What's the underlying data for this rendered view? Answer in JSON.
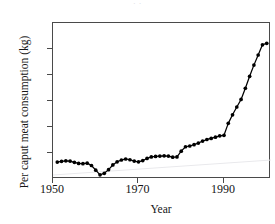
{
  "figure": {
    "title_remnant": "· ·",
    "background": "#ffffff",
    "line_color": "#000000",
    "marker_color": "#000000",
    "axis_color": "#4a4a4a",
    "artifact_color": "#e9e9ec"
  },
  "chart_data": {
    "type": "line",
    "title": "",
    "xlabel": "Year",
    "ylabel": "Per caput meat consumption (kg)",
    "xlim": [
      1950,
      2001
    ],
    "ylim": [
      0,
      60
    ],
    "xticks": [
      1950,
      1970,
      1990
    ],
    "xtick_labels": [
      "1950",
      "1970",
      "1990"
    ],
    "yticks": [
      0,
      10,
      20,
      30,
      40,
      50,
      60
    ],
    "ytick_labels": [
      "0",
      "10",
      "20",
      "30",
      "40",
      "50",
      "60"
    ],
    "grid": false,
    "legend": null,
    "markers": "filled-circle",
    "x": [
      1951,
      1952,
      1953,
      1954,
      1955,
      1956,
      1957,
      1958,
      1959,
      1960,
      1961,
      1962,
      1963,
      1964,
      1965,
      1966,
      1967,
      1968,
      1969,
      1970,
      1971,
      1972,
      1973,
      1974,
      1975,
      1976,
      1977,
      1978,
      1979,
      1980,
      1981,
      1982,
      1983,
      1984,
      1985,
      1986,
      1987,
      1988,
      1989,
      1990,
      1991,
      1992,
      1993,
      1994,
      1995,
      1996,
      1997,
      1998,
      1999,
      2000
    ],
    "values": [
      6.5,
      6.8,
      7.0,
      6.9,
      6.4,
      6.0,
      5.9,
      6.1,
      5.2,
      3.4,
      1.6,
      2.2,
      3.6,
      5.4,
      6.6,
      7.3,
      7.7,
      7.4,
      6.9,
      6.6,
      7.1,
      7.9,
      8.5,
      8.7,
      8.8,
      8.9,
      8.8,
      8.4,
      8.5,
      10.7,
      12.4,
      12.7,
      13.2,
      13.8,
      14.6,
      15.2,
      15.6,
      16.1,
      16.6,
      16.8,
      21.4,
      24.7,
      27.7,
      30.6,
      34.9,
      39.5,
      43.8,
      47.7,
      51.6,
      52.2
    ],
    "series": [
      {
        "name": "Per caput meat consumption",
        "color": "#000000",
        "values": [
          6.5,
          6.8,
          7.0,
          6.9,
          6.4,
          6.0,
          5.9,
          6.1,
          5.2,
          3.4,
          1.6,
          2.2,
          3.6,
          5.4,
          6.6,
          7.3,
          7.7,
          7.4,
          6.9,
          6.6,
          7.1,
          7.9,
          8.5,
          8.7,
          8.8,
          8.9,
          8.8,
          8.4,
          8.5,
          10.7,
          12.4,
          12.7,
          13.2,
          13.8,
          14.6,
          15.2,
          15.6,
          16.1,
          16.6,
          16.8,
          21.4,
          24.7,
          27.7,
          30.6,
          34.9,
          39.5,
          43.8,
          47.7,
          51.6,
          52.2
        ]
      }
    ],
    "final_point": {
      "year": 2000,
      "value": 53
    },
    "min_point": {
      "year": 1961,
      "value": 1.6
    }
  }
}
